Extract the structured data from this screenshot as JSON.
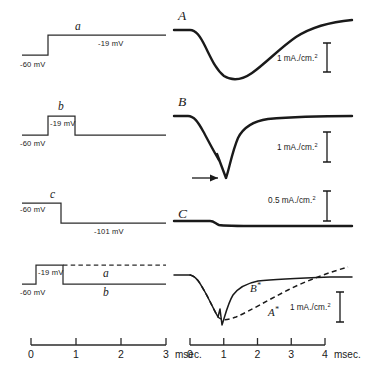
{
  "rows": [
    {
      "id": "row-a",
      "stimulus": {
        "letter": "a",
        "holding_label": "-60 mV",
        "step_label": "-19 mV",
        "type": "depolarizing-step-maintained"
      },
      "current": {
        "letter": "A",
        "scale_label_value": "1",
        "scale_label_unit": "mA./cm.",
        "scale_label_sup": "2",
        "description": "slow large inward current with gradual recovery"
      }
    },
    {
      "id": "row-b",
      "stimulus": {
        "letter": "b",
        "holding_label": "-60 mV",
        "step_label": "-19 mV",
        "type": "brief-depolarizing-pulse"
      },
      "current": {
        "letter": "B",
        "scale_label_value": "1",
        "scale_label_unit": "mA./cm.",
        "scale_label_sup": "2",
        "description": "inward current cut short by repolarization, sharp tail",
        "has_arrow": true
      }
    },
    {
      "id": "row-c",
      "stimulus": {
        "letter": "c",
        "holding_label": "-60 mV",
        "step_label": "-101 mV",
        "type": "hyperpolarizing-step"
      },
      "current": {
        "letter": "C",
        "scale_label_value": "0.5",
        "scale_label_unit": "mA./cm.",
        "scale_label_sup": "2",
        "description": "essentially no current, small step artifact"
      }
    },
    {
      "id": "row-d",
      "stimulus": {
        "letter": "",
        "holding_label": "-60 mV",
        "step_label": "-19 mV",
        "trace_a_label": "a",
        "trace_b_label": "b",
        "type": "overlay-a-dashed-b-solid"
      },
      "current": {
        "letter": "",
        "scale_label_value": "1",
        "scale_label_unit": "mA./cm.",
        "scale_label_sup": "2",
        "curve_b_label": "B",
        "curve_b_sup": "*",
        "curve_a_label": "A",
        "curve_a_sup": "*",
        "description": "difference records A* dashed and B* solid superimposed"
      }
    }
  ],
  "axes": {
    "left": {
      "ticks": [
        "0",
        "1",
        "2",
        "3"
      ],
      "unit": "msec."
    },
    "right": {
      "ticks": [
        "0",
        "1",
        "2",
        "3",
        "4"
      ],
      "unit": "msec."
    }
  },
  "colors": {
    "ink": "#1a1a1a",
    "ink_light": "#2b2b2b",
    "background": "#ffffff"
  }
}
